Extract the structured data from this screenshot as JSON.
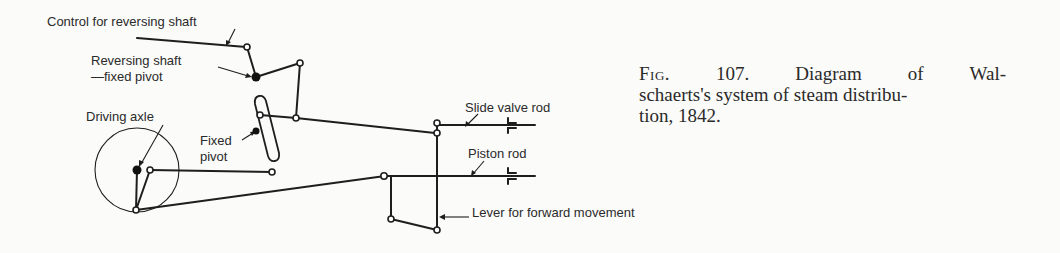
{
  "figure": {
    "number": "107.",
    "prefix": "Fig.",
    "caption_line1": "Diagram of Wal-",
    "caption_line2": "schaerts's system of steam distribu-",
    "caption_line3": "tion, 1842.",
    "caption_text": "Diagram of Walschaerts's system of steam distribution, 1842."
  },
  "labels": {
    "control": "Control for reversing shaft",
    "reversing_shaft_line1": "Reversing shaft",
    "reversing_shaft_line2": "—fixed pivot",
    "driving_axle": "Driving axle",
    "fixed_pivot_line1": "Fixed",
    "fixed_pivot_line2": "pivot",
    "slide_valve_rod": "Slide valve rod",
    "piston_rod": "Piston rod",
    "lever": "Lever for forward movement"
  },
  "colors": {
    "ink": "#1e1e1e",
    "paper": "#fbfbf9"
  }
}
